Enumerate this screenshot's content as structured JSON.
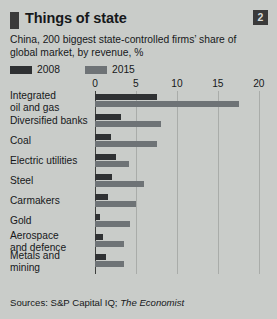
{
  "panel": {
    "number": "2",
    "title": "Things of state",
    "subtitle": "China, 200 biggest state-controlled firms’ share of global market, by revenue, %",
    "source_prefix": "Sources: S&P Capital IQ; ",
    "source_italic": "The Economist"
  },
  "chart_data": {
    "type": "bar",
    "orientation": "horizontal",
    "title": "Things of state",
    "subtitle": "China, 200 biggest state-controlled firms’ share of global market, by revenue, %",
    "xlabel": "",
    "ylabel": "",
    "xlim": [
      0,
      21
    ],
    "ticks": [
      0,
      5,
      10,
      15,
      20
    ],
    "tick_labels": [
      "0",
      "5",
      "10",
      "15",
      "20"
    ],
    "grid": true,
    "legend_position": "top-left",
    "categories": [
      "Integrated oil and gas",
      "Diversified banks",
      "Coal",
      "Electric utilities",
      "Steel",
      "Carmakers",
      "Gold",
      "Aerospace and defence",
      "Metals and mining"
    ],
    "category_lines": [
      [
        "Integrated",
        "oil and gas"
      ],
      [
        "Diversified banks"
      ],
      [
        "Coal"
      ],
      [
        "Electric utilities"
      ],
      [
        "Steel"
      ],
      [
        "Carmakers"
      ],
      [
        "Gold"
      ],
      [
        "Aerospace",
        "and defence"
      ],
      [
        "Metals and mining"
      ]
    ],
    "series": [
      {
        "name": "2008",
        "color": "#2f3133",
        "values": [
          7.6,
          3.2,
          2.0,
          2.6,
          2.1,
          1.6,
          0.6,
          1.0,
          1.4
        ]
      },
      {
        "name": "2015",
        "color": "#6e7376",
        "values": [
          17.6,
          8.0,
          7.6,
          4.2,
          6.0,
          5.0,
          4.3,
          3.6,
          3.6
        ]
      }
    ]
  }
}
